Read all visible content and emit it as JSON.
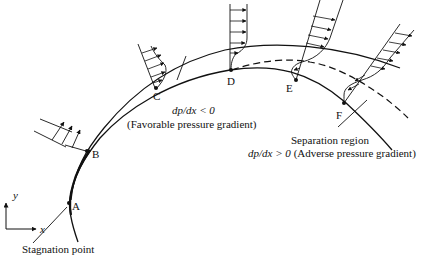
{
  "diagram": {
    "type": "boundary-layer-separation",
    "points": [
      {
        "id": "A",
        "label": "A"
      },
      {
        "id": "B",
        "label": "B"
      },
      {
        "id": "C",
        "label": "C"
      },
      {
        "id": "D",
        "label": "D"
      },
      {
        "id": "E",
        "label": "E"
      },
      {
        "id": "F",
        "label": "F"
      }
    ],
    "axes": {
      "x_label": "x",
      "y_label": "y"
    },
    "favorable": {
      "equation": "dp/dx < 0",
      "description": "(Favorable pressure gradient)"
    },
    "adverse": {
      "title": "Separation region",
      "equation": "dp/dx > 0",
      "description": "(Adverse pressure gradient)"
    },
    "stagnation_label": "Stagnation point"
  }
}
